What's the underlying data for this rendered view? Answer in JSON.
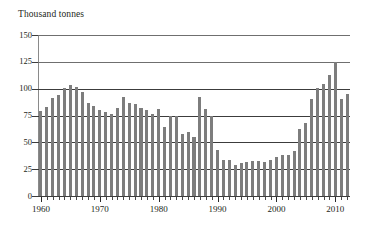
{
  "chart_data": {
    "type": "bar",
    "title": "Thousand tonnes",
    "subtitle": "",
    "xlabel": "",
    "ylabel": "Thousand tonnes",
    "ylim": [
      0,
      150
    ],
    "xlim": [
      1960,
      2012
    ],
    "grid": true,
    "legend": null,
    "bar_color": "#7d7d7d",
    "y_ticks": [
      0,
      25,
      50,
      75,
      100,
      125,
      150
    ],
    "y_tick_labels": [
      "0",
      "25",
      "50",
      "75",
      "100",
      "125",
      "150"
    ],
    "x_tick_labels": [
      "1960",
      "1970",
      "1980",
      "1990",
      "2000",
      "2010"
    ],
    "x_tick_values": [
      1960,
      1970,
      1980,
      1990,
      2000,
      2010
    ],
    "categories": [
      1960,
      1961,
      1962,
      1963,
      1964,
      1965,
      1966,
      1967,
      1968,
      1969,
      1970,
      1971,
      1972,
      1973,
      1974,
      1975,
      1976,
      1977,
      1978,
      1979,
      1980,
      1981,
      1982,
      1983,
      1984,
      1985,
      1986,
      1987,
      1988,
      1989,
      1990,
      1991,
      1992,
      1993,
      1994,
      1995,
      1996,
      1997,
      1998,
      1999,
      2000,
      2001,
      2002,
      2003,
      2004,
      2005,
      2006,
      2007,
      2008,
      2009,
      2010,
      2011,
      2012
    ],
    "values": [
      79,
      83,
      91,
      94,
      101,
      103,
      102,
      97,
      87,
      84,
      80,
      78,
      76,
      82,
      92,
      87,
      86,
      82,
      80,
      76,
      81,
      64,
      75,
      75,
      58,
      60,
      55,
      92,
      81,
      75,
      43,
      34,
      34,
      29,
      31,
      32,
      33,
      33,
      32,
      34,
      36,
      38,
      38,
      42,
      62,
      68,
      90,
      101,
      104,
      113,
      125,
      90,
      95
    ]
  }
}
